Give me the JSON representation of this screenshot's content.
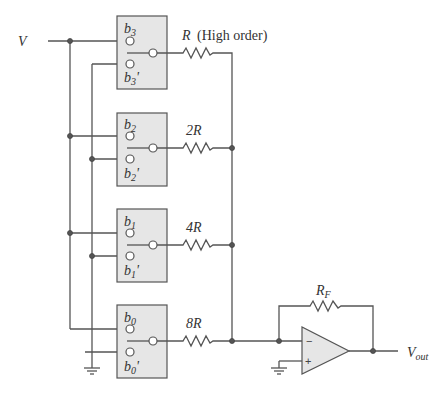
{
  "diagram": {
    "input_label": "V",
    "output_label": "V",
    "output_sub": "out",
    "feedback": {
      "label": "R",
      "sub": "F"
    },
    "switches": [
      {
        "bit": "b",
        "sub": "3",
        "prime": "b",
        "prime_sub": "3",
        "resistor": "R",
        "resistor_note": "(High order)"
      },
      {
        "bit": "b",
        "sub": "2",
        "prime": "b",
        "prime_sub": "2",
        "resistor": "2R"
      },
      {
        "bit": "b",
        "sub": "1",
        "prime": "b",
        "prime_sub": "1",
        "resistor": "4R"
      },
      {
        "bit": "b",
        "sub": "0",
        "prime": "b",
        "prime_sub": "0",
        "resistor": "8R"
      }
    ],
    "opamp": {
      "inverting": "−",
      "noninverting": "+"
    }
  }
}
